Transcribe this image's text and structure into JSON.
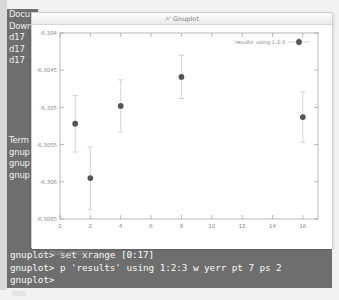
{
  "window": {
    "title": "Gnuplot",
    "icon": "gnuplot-icon"
  },
  "sidebar": {
    "top_items": [
      {
        "label": "Docu"
      },
      {
        "label": "Down"
      },
      {
        "label": "d17"
      },
      {
        "label": "d17"
      },
      {
        "label": "d17"
      }
    ],
    "bottom_items": [
      {
        "label": "Term"
      },
      {
        "label": "gnup"
      },
      {
        "label": "gnup"
      },
      {
        "label": "gnup"
      }
    ]
  },
  "terminal": {
    "lines": [
      "gnuplot> set xrange [0:17]",
      "gnuplot> p 'results' using 1:2:3 w yerr pt 7 ps 2",
      "gnuplot>"
    ]
  },
  "plot": {
    "coordinate_readout": "11.7528, -6.30573",
    "legend_label": "'results' using 1:2:3",
    "point_color": "#555555",
    "errorbar_color": "#c9c9c9",
    "axis_color": "#9a9a9a",
    "tick_label_color": "#888888"
  },
  "chart_data": {
    "type": "scatter",
    "title": "",
    "xlabel": "",
    "ylabel": "",
    "xlim": [
      0,
      17
    ],
    "ylim": [
      -6.3065,
      -6.304
    ],
    "grid": false,
    "legend_position": "top-right",
    "legend": [
      "'results' using 1:2:3"
    ],
    "xticks": [
      0,
      2,
      4,
      6,
      8,
      10,
      12,
      14,
      16
    ],
    "xtick_labels": [
      "0",
      "2",
      "4",
      "6",
      "8",
      "10",
      "12",
      "14",
      "16"
    ],
    "yticks": [
      -6.304,
      -6.3045,
      -6.305,
      -6.3055,
      -6.306,
      -6.3065
    ],
    "ytick_labels": [
      "-6.304",
      "-6.3045",
      "-6.305",
      "-6.3055",
      "-6.306",
      "-6.3065"
    ],
    "series": [
      {
        "name": "'results' using 1:2:3",
        "style": "yerrorbars",
        "pointtype": 7,
        "pointsize": 2,
        "x": [
          1,
          2,
          4,
          8,
          16
        ],
        "y": [
          -6.30522,
          -6.30595,
          -6.30498,
          -6.30459,
          -6.30513
        ],
        "yerr": [
          0.00038,
          0.00042,
          0.00035,
          0.00029,
          0.00034
        ]
      }
    ]
  }
}
